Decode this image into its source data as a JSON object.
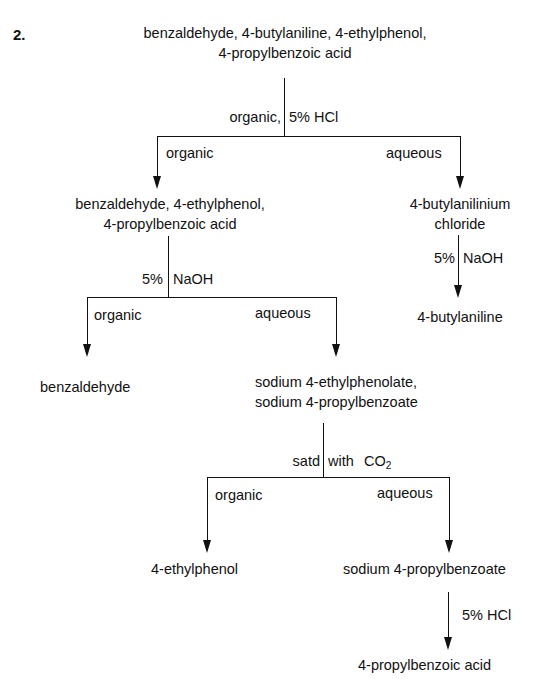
{
  "problem_number": "2.",
  "start_mixture": {
    "line1": "benzaldehyde, 4-butylaniline, 4-ethylphenol,",
    "line2": "4-propylbenzoic acid"
  },
  "step1": {
    "left_label": "organic,",
    "right_label": "5% HCl",
    "branch_left": "organic",
    "branch_right": "aqueous"
  },
  "organic1": {
    "line1": "benzaldehyde, 4-ethylphenol,",
    "line2": "4-propylbenzoic acid"
  },
  "aqueous1": {
    "line1": "4-butylanilinium",
    "line2": "chloride"
  },
  "step_aq1": {
    "left_label": "5%",
    "right_label": "NaOH"
  },
  "product_amine": "4-butylaniline",
  "step2": {
    "left_label": "5%",
    "right_label": "NaOH",
    "branch_left": "organic",
    "branch_right": "aqueous"
  },
  "product_aldehyde": "benzaldehyde",
  "aqueous2": {
    "line1": "sodium 4-ethylphenolate,",
    "line2": "sodium 4-propylbenzoate"
  },
  "step3": {
    "left_label": "satd",
    "right_label": "with",
    "reagent": "CO",
    "reagent_subscript": "2",
    "branch_left": "organic",
    "branch_right": "aqueous"
  },
  "product_phenol": "4-ethylphenol",
  "aqueous3": "sodium 4-propylbenzoate",
  "step4": {
    "right_label": "5% HCl"
  },
  "product_acid": "4-propylbenzoic acid"
}
